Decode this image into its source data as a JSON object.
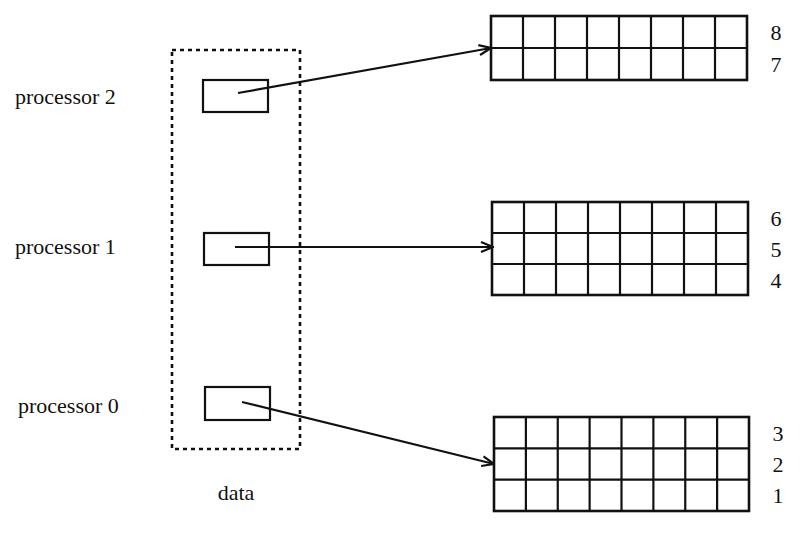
{
  "diagram": {
    "title": "",
    "data_container": {
      "label": "data",
      "x": 172,
      "y": 50,
      "width": 128,
      "height": 399,
      "label_x": 236,
      "label_y": 500
    },
    "processors": [
      {
        "id": "processor-2",
        "label": "processor 2",
        "label_x": 15,
        "label_y": 104,
        "box": {
          "x": 203,
          "y": 80,
          "width": 65,
          "height": 32
        },
        "arrow": {
          "x1": 238,
          "y1": 93,
          "x2": 491,
          "y2": 48
        },
        "target_grid": 0
      },
      {
        "id": "processor-1",
        "label": "processor 1",
        "label_x": 15,
        "label_y": 254,
        "box": {
          "x": 204,
          "y": 233,
          "width": 65,
          "height": 32
        },
        "arrow": {
          "x1": 235,
          "y1": 247,
          "x2": 493,
          "y2": 247
        },
        "target_grid": 1
      },
      {
        "id": "processor-0",
        "label": "processor 0",
        "label_x": 18,
        "label_y": 413,
        "box": {
          "x": 205,
          "y": 387,
          "width": 65,
          "height": 33
        },
        "arrow": {
          "x1": 242,
          "y1": 402,
          "x2": 494,
          "y2": 464
        },
        "target_grid": 2
      }
    ],
    "grids": [
      {
        "id": "grid-top",
        "x": 491,
        "y": 16,
        "width": 256,
        "height": 64,
        "cols": 8,
        "rows": 2,
        "row_labels": [
          "8",
          "7"
        ],
        "label_x": 776
      },
      {
        "id": "grid-middle",
        "x": 492,
        "y": 202,
        "width": 256,
        "height": 93,
        "cols": 8,
        "rows": 3,
        "row_labels": [
          "6",
          "5",
          "4"
        ],
        "label_x": 776
      },
      {
        "id": "grid-bottom",
        "x": 494,
        "y": 417,
        "width": 255,
        "height": 94,
        "cols": 8,
        "rows": 3,
        "row_labels": [
          "3",
          "2",
          "1"
        ],
        "label_x": 778
      }
    ],
    "colors": {
      "ink": "#111111",
      "background": "#ffffff"
    }
  }
}
